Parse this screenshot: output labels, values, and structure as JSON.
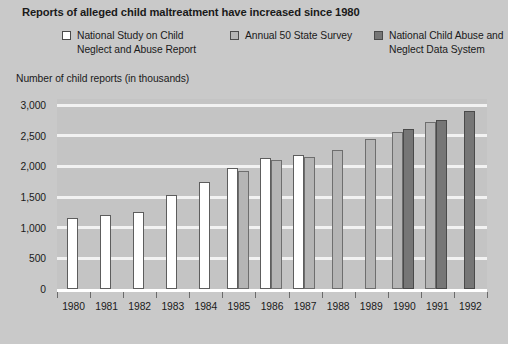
{
  "title": "Reports of alleged child maltreatment have increased since 1980",
  "legend": [
    {
      "label": "National Study on Child Neglect and Abuse Report",
      "color": "#ffffff"
    },
    {
      "label": "Annual 50 State Survey",
      "color": "#b5b5b5"
    },
    {
      "label": "National Child Abuse and Neglect Data System",
      "color": "#767676"
    }
  ],
  "chart_data": {
    "type": "bar",
    "title": "Reports of alleged child maltreatment have increased since 1980",
    "xlabel": "",
    "ylabel": "Number of child reports (in thousands)",
    "ylim": [
      0,
      3000
    ],
    "yticks": [
      "0",
      "500",
      "1,000",
      "1,500",
      "2,000",
      "2,500",
      "3,000"
    ],
    "ytick_values": [
      0,
      500,
      1000,
      1500,
      2000,
      2500,
      3000
    ],
    "grid": true,
    "legend_position": "top",
    "categories": [
      "1980",
      "1981",
      "1982",
      "1983",
      "1984",
      "1985",
      "1986",
      "1987",
      "1988",
      "1989",
      "1990",
      "1991",
      "1992"
    ],
    "series": [
      {
        "name": "National Study on Child Neglect and Abuse Report",
        "color": "#ffffff",
        "values": [
          1150,
          1210,
          1250,
          1530,
          1740,
          1970,
          2140,
          2180,
          null,
          null,
          null,
          null,
          null
        ]
      },
      {
        "name": "Annual 50 State Survey",
        "color": "#b5b5b5",
        "values": [
          null,
          null,
          null,
          null,
          null,
          1930,
          2110,
          2160,
          2270,
          2440,
          2560,
          2720,
          null
        ]
      },
      {
        "name": "National Child Abuse and Neglect Data System",
        "color": "#767676",
        "values": [
          null,
          null,
          null,
          null,
          null,
          null,
          null,
          null,
          null,
          null,
          2610,
          2760,
          2900
        ]
      }
    ]
  },
  "colors": {
    "page_background": "#c9c9c9",
    "plot_background": "#c4c4c4",
    "gridline": "#f2f2f2",
    "axis": "#ffffff",
    "text": "#1a1a1a"
  }
}
